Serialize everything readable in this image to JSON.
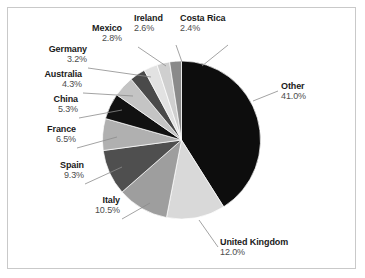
{
  "figure": {
    "background": "#ffffff",
    "frame_color": "#c9c9c9"
  },
  "chart_data": {
    "type": "pie",
    "title": "",
    "subtitle": "",
    "xlabel": "",
    "ylabel": "",
    "legend_position": "none",
    "grid": false,
    "start_angle_deg": 90,
    "direction": "clockwise",
    "value_unit": "percent",
    "categories": [
      "Other",
      "United Kingdom",
      "Italy",
      "Spain",
      "France",
      "China",
      "Australia",
      "Germany",
      "Mexico",
      "Ireland",
      "Costa Rica"
    ],
    "values": [
      41.0,
      12.0,
      10.5,
      9.3,
      6.5,
      5.3,
      4.3,
      3.2,
      2.8,
      2.6,
      2.4
    ],
    "labels": [
      "41.0%",
      "12.0%",
      "10.5%",
      "9.3%",
      "6.5%",
      "5.3%",
      "4.3%",
      "3.2%",
      "2.8%",
      "2.6%",
      "2.4%"
    ],
    "colors": [
      "#0d0d0d",
      "#d9d9d9",
      "#9e9e9e",
      "#4f4f4f",
      "#b0b0b0",
      "#111111",
      "#c4c4c4",
      "#4a4a4a",
      "#e2e2e2",
      "#cfcfcf",
      "#8a8a8a"
    ],
    "slices": [
      {
        "name": "Other",
        "value": 41.0,
        "label": "41.0%",
        "color": "#0d0d0d"
      },
      {
        "name": "United Kingdom",
        "value": 12.0,
        "label": "12.0%",
        "color": "#d9d9d9"
      },
      {
        "name": "Italy",
        "value": 10.5,
        "label": "10.5%",
        "color": "#9e9e9e"
      },
      {
        "name": "Spain",
        "value": 9.3,
        "label": "9.3%",
        "color": "#4f4f4f"
      },
      {
        "name": "France",
        "value": 6.5,
        "label": "6.5%",
        "color": "#b0b0b0"
      },
      {
        "name": "China",
        "value": 5.3,
        "label": "5.3%",
        "color": "#111111"
      },
      {
        "name": "Australia",
        "value": 4.3,
        "label": "4.3%",
        "color": "#c4c4c4"
      },
      {
        "name": "Germany",
        "value": 3.2,
        "label": "3.2%",
        "color": "#4a4a4a"
      },
      {
        "name": "Mexico",
        "value": 2.8,
        "label": "2.8%",
        "color": "#e2e2e2"
      },
      {
        "name": "Ireland",
        "value": 2.6,
        "label": "2.6%",
        "color": "#cfcfcf"
      },
      {
        "name": "Costa Rica",
        "value": 2.4,
        "label": "2.4%",
        "color": "#8a8a8a"
      }
    ]
  },
  "annotations": {
    "costa_rica": {
      "name": "Costa Rica",
      "pct": "2.4%"
    },
    "ireland": {
      "name": "Ireland",
      "pct": "2.6%"
    },
    "mexico": {
      "name": "Mexico",
      "pct": "2.8%"
    },
    "germany": {
      "name": "Germany",
      "pct": "3.2%"
    },
    "australia": {
      "name": "Australia",
      "pct": "4.3%"
    },
    "china": {
      "name": "China",
      "pct": "5.3%"
    },
    "france": {
      "name": "France",
      "pct": "6.5%"
    },
    "spain": {
      "name": "Spain",
      "pct": "9.3%"
    },
    "italy": {
      "name": "Italy",
      "pct": "10.5%"
    },
    "united_kingdom": {
      "name": "United Kingdom",
      "pct": "12.0%"
    },
    "other": {
      "name": "Other",
      "pct": "41.0%"
    }
  }
}
